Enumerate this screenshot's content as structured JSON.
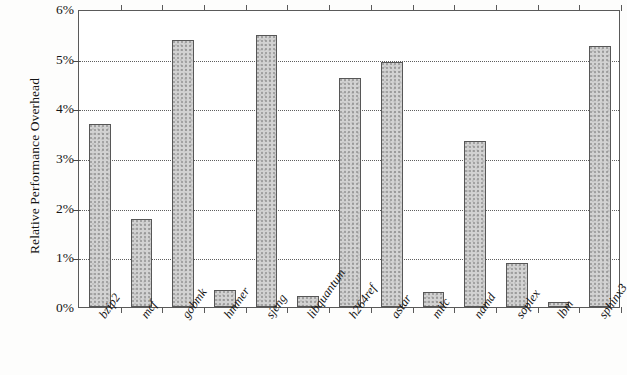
{
  "chart_data": {
    "type": "bar",
    "title": "",
    "subtitle": "",
    "xlabel": "",
    "ylabel": "Relative Performance Overhead",
    "ylim": [
      0,
      6
    ],
    "ytick_values": [
      0,
      1,
      2,
      3,
      4,
      5,
      6
    ],
    "ytick_labels": [
      "0%",
      "1%",
      "2%",
      "3%",
      "4%",
      "5%",
      "6%"
    ],
    "grid": true,
    "grid_axis": "y",
    "grid_style": "dotted",
    "legend": null,
    "legend_position": "none",
    "bar_fill_color": "#d2d2d2",
    "bar_edge_color": "#575757",
    "categories": [
      "bzip2",
      "mcf",
      "gobmk",
      "hmmer",
      "sjeng",
      "libquantum",
      "h264ref",
      "astar",
      "milc",
      "namd",
      "soplex",
      "lbm",
      "sphinx3"
    ],
    "values": [
      3.68,
      1.77,
      5.38,
      0.34,
      5.47,
      0.22,
      4.62,
      4.94,
      0.3,
      3.35,
      0.88,
      0.1,
      5.26
    ],
    "value_unit": "%"
  }
}
